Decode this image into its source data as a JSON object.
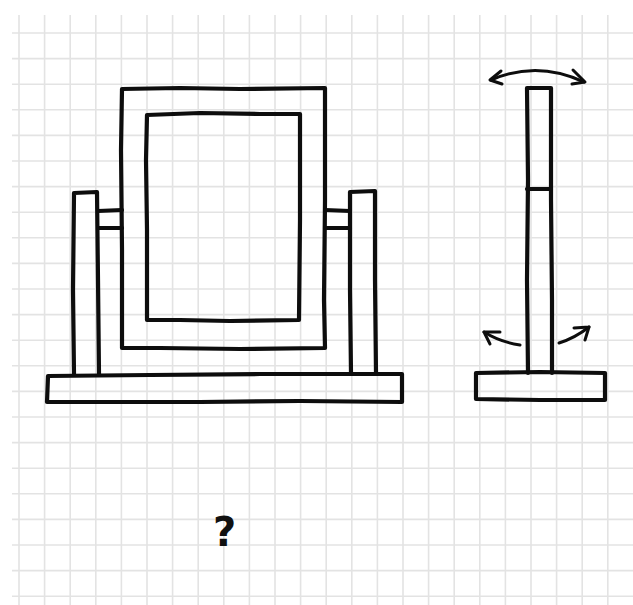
{
  "figure": {
    "background": "#ffffff",
    "grid_color": "#e3e3e3",
    "ink_color": "#0d0d0d",
    "grid": {
      "spacing_px": 25.6,
      "x_start": 19,
      "y_start": 33
    },
    "front_view": {
      "label": "front-view",
      "outer_frame": {
        "x": 122,
        "y": 88,
        "w": 203,
        "h": 260
      },
      "inner_mirror": {
        "x": 147,
        "y": 114,
        "w": 153,
        "h": 206
      },
      "left_post": {
        "x": 73,
        "y": 192,
        "w": 25,
        "h": 183
      },
      "right_post": {
        "x": 350,
        "y": 191,
        "w": 26,
        "h": 184
      },
      "left_pivot": {
        "x": 98,
        "y": 210,
        "w": 24,
        "h": 18
      },
      "right_pivot": {
        "x": 325,
        "y": 210,
        "w": 25,
        "h": 18
      },
      "base": {
        "x": 47,
        "y": 375,
        "w": 355,
        "h": 27
      }
    },
    "side_view": {
      "label": "side-view",
      "post": {
        "x": 527,
        "y": 88,
        "w": 25,
        "h": 285,
        "divider_y": 189
      },
      "base": {
        "x": 476,
        "y": 373,
        "w": 129,
        "h": 27
      },
      "arrows": [
        "tilt-arrow-top",
        "swing-arrow-left",
        "swing-arrow-right"
      ]
    },
    "annotation": {
      "text": "?"
    }
  }
}
